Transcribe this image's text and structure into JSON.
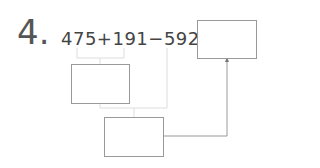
{
  "problem": {
    "number": "4.",
    "expression": "475+191−592=",
    "boxes": [
      "answer-box",
      "intermediate-box-1",
      "intermediate-box-2"
    ]
  }
}
